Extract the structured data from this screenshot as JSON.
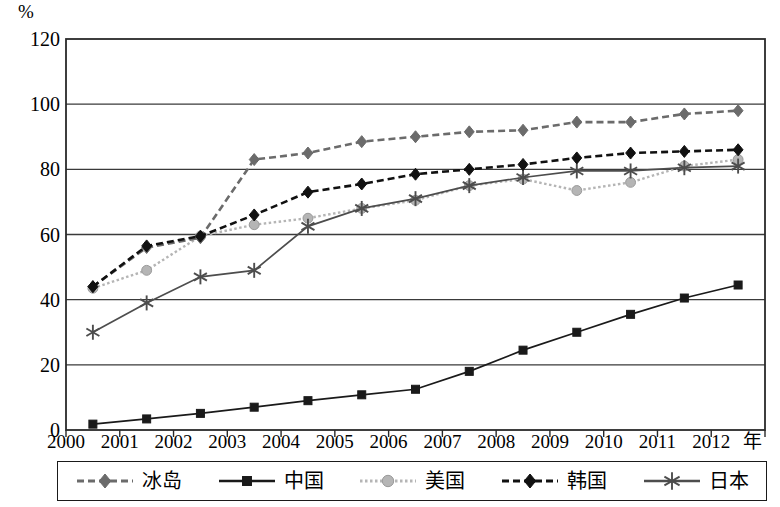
{
  "axes": {
    "y_unit": "%",
    "y_ticks": [
      "120",
      "100",
      "80",
      "60",
      "40",
      "20",
      "0"
    ],
    "x_ticks": [
      "2000",
      "2001",
      "2002",
      "2003",
      "2004",
      "2005",
      "2006",
      "2007",
      "2008",
      "2009",
      "2010",
      "2011",
      "2012"
    ],
    "x_unit": "年"
  },
  "legend": {
    "items": [
      {
        "label": "冰岛",
        "marker": "diamond",
        "style": "dashed",
        "color": "#6b6b6b"
      },
      {
        "label": "中国",
        "marker": "square",
        "style": "solid",
        "color": "#1a1a1a"
      },
      {
        "label": "美国",
        "marker": "circle",
        "style": "dotted",
        "color": "#b5b5b5"
      },
      {
        "label": "韩国",
        "marker": "diamond",
        "style": "dashed",
        "color": "#111111"
      },
      {
        "label": "日本",
        "marker": "asterisk",
        "style": "solid",
        "color": "#4d4d4d"
      }
    ]
  },
  "chart_data": {
    "type": "line",
    "title": "",
    "xlabel": "年",
    "ylabel": "%",
    "ylim": [
      0,
      120
    ],
    "xlim": [
      2000,
      2013
    ],
    "grid": true,
    "legend_position": "bottom",
    "x": [
      2000,
      2001,
      2002,
      2003,
      2004,
      2005,
      2006,
      2007,
      2008,
      2009,
      2010,
      2011,
      2012
    ],
    "series": [
      {
        "name": "冰岛",
        "color": "#6b6b6b",
        "marker": "diamond",
        "style": "dashed",
        "values": [
          44,
          56,
          59,
          83,
          85,
          88.5,
          90,
          91.5,
          92,
          94.5,
          94.5,
          97,
          98
        ]
      },
      {
        "name": "中国",
        "color": "#1a1a1a",
        "marker": "square",
        "style": "solid",
        "values": [
          1.8,
          3.4,
          5.1,
          7,
          9,
          10.8,
          12.5,
          18,
          24.5,
          30,
          35.5,
          40.5,
          44.5
        ]
      },
      {
        "name": "美国",
        "color": "#b5b5b5",
        "marker": "circle",
        "style": "dotted",
        "values": [
          43.5,
          49,
          59.5,
          63,
          65,
          68,
          70.5,
          75,
          77,
          73.5,
          76,
          81,
          83
        ]
      },
      {
        "name": "韩国",
        "color": "#111111",
        "marker": "diamond",
        "style": "dashed",
        "values": [
          44,
          56.5,
          59.5,
          66,
          73,
          75.5,
          78.5,
          80,
          81.5,
          83.5,
          85,
          85.5,
          86
        ]
      },
      {
        "name": "日本",
        "color": "#4d4d4d",
        "marker": "asterisk",
        "style": "solid",
        "values": [
          30,
          39,
          47,
          49,
          62.5,
          68,
          71,
          75,
          77.5,
          79.5,
          79.5,
          80.5,
          81
        ]
      }
    ]
  }
}
